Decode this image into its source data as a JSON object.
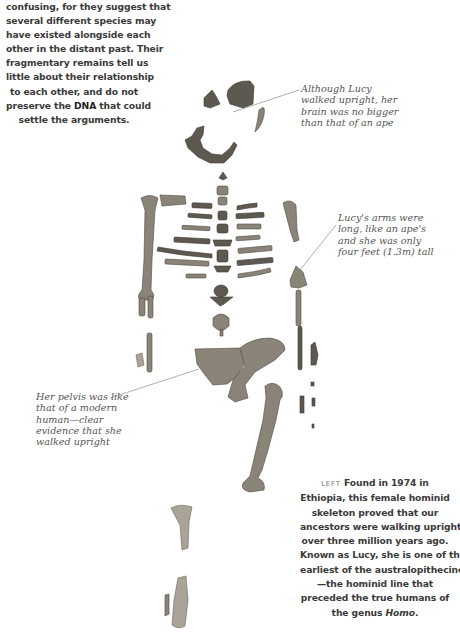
{
  "intro_text": {
    "lines": [
      "confusing, for they suggest that",
      "several different species may",
      "have existed alongside each",
      "other in the distant past. Their",
      "fragmentary remains tell us",
      "little about their relationship",
      "to each other, and do not",
      "preserve the DNA that could",
      "settle the arguments."
    ]
  },
  "annotations": {
    "brain": {
      "lines": [
        "Although Lucy",
        "walked upright, her",
        "brain was no bigger",
        "than that of an ape"
      ]
    },
    "arms": {
      "lines": [
        "Lucy's arms were",
        "long, like an ape's",
        "and she was only",
        "four feet (1.3m) tall"
      ]
    },
    "pelvis": {
      "lines": [
        "Her pelvis was like",
        "that of a modern",
        "human—clear",
        "evidence that she",
        "walked upright"
      ]
    }
  },
  "caption": {
    "label": "LEFT",
    "first_line_rest": "Found in 1974 in",
    "lines": [
      "Ethiopia, this female hominid",
      "skeleton proved that our",
      "ancestors were walking upright",
      "over three million years ago.",
      "Known as Lucy, she is one of the",
      "earliest of the australopithecines",
      "—the hominid line that",
      "preceded the true humans of"
    ],
    "last_line_prefix": "the genus ",
    "last_line_italic": "Homo",
    "last_line_suffix": "."
  },
  "figure": {
    "icon": "skeleton-fossil-illustration"
  }
}
